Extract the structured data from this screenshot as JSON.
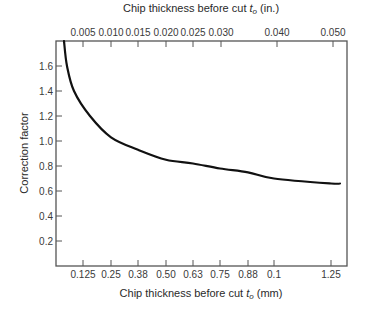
{
  "chart_data": {
    "type": "line",
    "title": "",
    "xlabel": "Chip thickness before cut t_o (mm)",
    "xlabel_parts": {
      "prefix": "Chip thickness before cut ",
      "var": "t",
      "sub": "o",
      "suffix": " (mm)"
    },
    "x2label": "Chip thickness before cut t_o (in.)",
    "x2label_parts": {
      "prefix": "Chip thickness before cut ",
      "var": "t",
      "sub": "o",
      "suffix": " (in.)"
    },
    "ylabel": "Correction factor",
    "ylim": [
      0,
      1.8
    ],
    "grid": false,
    "legend": null,
    "x_ticks_bottom": [
      {
        "label": "0.125",
        "px": 83
      },
      {
        "label": "0.25",
        "px": 111
      },
      {
        "label": "0.38",
        "px": 138
      },
      {
        "label": "0.50",
        "px": 166
      },
      {
        "label": "0.63",
        "px": 193
      },
      {
        "label": "0.75",
        "px": 220
      },
      {
        "label": "0.88",
        "px": 248
      },
      {
        "label": "0.1",
        "px": 274
      },
      {
        "label": "1.25",
        "px": 331
      }
    ],
    "x_ticks_top": [
      {
        "label": "0.005",
        "px": 83
      },
      {
        "label": "0.010",
        "px": 111
      },
      {
        "label": "0.015",
        "px": 138
      },
      {
        "label": "0.020",
        "px": 166
      },
      {
        "label": "0.025",
        "px": 193
      },
      {
        "label": "0.030",
        "px": 221
      },
      {
        "label": "0.040",
        "px": 277
      },
      {
        "label": "0.050",
        "px": 333
      }
    ],
    "y_ticks": [
      "0.2",
      "0.4",
      "0.6",
      "0.8",
      "1.0",
      "1.2",
      "1.4",
      "1.6"
    ],
    "series": [
      {
        "name": "Correction factor",
        "x_mm": [
          0.09,
          0.1,
          0.11,
          0.16,
          0.25,
          0.38,
          0.5,
          0.63,
          0.75,
          0.88,
          1.0,
          1.25,
          1.3
        ],
        "values": [
          1.8,
          1.6,
          1.4,
          1.2,
          1.03,
          0.93,
          0.85,
          0.82,
          0.78,
          0.75,
          0.7,
          0.66,
          0.66
        ]
      }
    ]
  }
}
